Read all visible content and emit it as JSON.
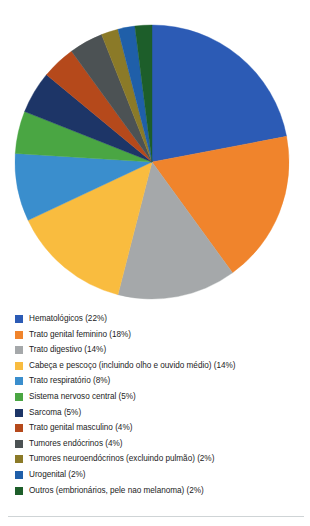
{
  "chart_data": {
    "type": "pie",
    "title": "",
    "subtitle": "",
    "xlabel": "",
    "ylabel": "",
    "legend_position": "bottom-left",
    "grid": false,
    "units": "percent",
    "start_angle_deg": 0,
    "direction": "clockwise",
    "categories": [
      "Hematológicos",
      "Trato genital feminino",
      "Trato digestivo",
      "Cabeça e pescoço (incluindo olho e ouvido médio)",
      "Trato respiratório",
      "Sistema nervoso central",
      "Sarcoma",
      "Trato genital masculino",
      "Tumores endócrinos",
      "Tumores neuroendócrinos (excluindo pulmão)",
      "Urogenital",
      "Outros (embrionários, pele nao melanoma)"
    ],
    "values": [
      22,
      18,
      14,
      14,
      8,
      5,
      5,
      4,
      4,
      2,
      2,
      2
    ],
    "colors": [
      "#2c5bb5",
      "#f0842c",
      "#a5a8aa",
      "#f9bc3f",
      "#3a8ecd",
      "#4aa643",
      "#1d3567",
      "#b5491b",
      "#4c5254",
      "#8b7a28",
      "#1f5fa9",
      "#1d5e2a"
    ],
    "slices": [
      {
        "label": "Hematológicos",
        "value": 22,
        "display": "22%",
        "color": "#2c5bb5"
      },
      {
        "label": "Trato genital feminino",
        "value": 18,
        "display": "18%",
        "color": "#f0842c"
      },
      {
        "label": "Trato digestivo",
        "value": 14,
        "display": "14%",
        "color": "#a5a8aa"
      },
      {
        "label": "Cabeça e pescoço (incluindo olho e ouvido médio)",
        "value": 14,
        "display": "14%",
        "color": "#f9bc3f"
      },
      {
        "label": "Trato respiratório",
        "value": 8,
        "display": "8%",
        "color": "#3a8ecd"
      },
      {
        "label": "Sistema nervoso central",
        "value": 5,
        "display": "5%",
        "color": "#4aa643"
      },
      {
        "label": "Sarcoma",
        "value": 5,
        "display": "5%",
        "color": "#1d3567"
      },
      {
        "label": "Trato genital masculino",
        "value": 4,
        "display": "4%",
        "color": "#b5491b"
      },
      {
        "label": "Tumores endócrinos",
        "value": 4,
        "display": "4%",
        "color": "#4c5254"
      },
      {
        "label": "Tumores neuroendócrinos (excluindo pulmão)",
        "value": 2,
        "display": "2%",
        "color": "#8b7a28"
      },
      {
        "label": "Urogenital",
        "value": 2,
        "display": "2%",
        "color": "#1f5fa9"
      },
      {
        "label": "Outros (embrionários, pele nao melanoma)",
        "value": 2,
        "display": "2%",
        "color": "#1d5e2a"
      }
    ]
  },
  "legend": {
    "items": [
      {
        "text": "Hematológicos (22%)",
        "color": "#2c5bb5"
      },
      {
        "text": "Trato genital feminino (18%)",
        "color": "#f0842c"
      },
      {
        "text": "Trato digestivo (14%)",
        "color": "#a5a8aa"
      },
      {
        "text": "Cabeça e pescoço (incluindo olho e ouvido médio) (14%)",
        "color": "#f9bc3f"
      },
      {
        "text": "Trato respiratório (8%)",
        "color": "#3a8ecd"
      },
      {
        "text": "Sistema nervoso central (5%)",
        "color": "#4aa643"
      },
      {
        "text": "Sarcoma (5%)",
        "color": "#1d3567"
      },
      {
        "text": "Trato genital masculino (4%)",
        "color": "#b5491b"
      },
      {
        "text": "Tumores endócrinos (4%)",
        "color": "#4c5254"
      },
      {
        "text": "Tumores neuroendócrinos (excluindo pulmão) (2%)",
        "color": "#8b7a28"
      },
      {
        "text": "Urogenital (2%)",
        "color": "#1f5fa9"
      },
      {
        "text": "Outros (embrionários, pele nao melanoma) (2%)",
        "color": "#1d5e2a"
      }
    ]
  }
}
